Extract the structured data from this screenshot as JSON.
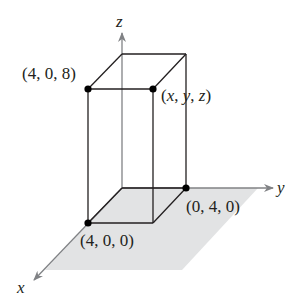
{
  "diagram": {
    "type": "3d-rectangular-box",
    "axes": {
      "x": {
        "label": "x"
      },
      "y": {
        "label": "y"
      },
      "z": {
        "label": "z"
      }
    },
    "points": [
      {
        "id": "p408",
        "label": "(4, 0, 8)"
      },
      {
        "id": "pxyz",
        "label_parts": [
          "(",
          "x",
          ", ",
          "y",
          ", ",
          "z",
          ")"
        ]
      },
      {
        "id": "p040",
        "label": "(0, 4, 0)"
      },
      {
        "id": "p400",
        "label": "(4, 0, 0)"
      }
    ],
    "colors": {
      "axis": "#808285",
      "edge": "#231f20",
      "plane": "#e2e3e4",
      "point": "#000000"
    }
  }
}
